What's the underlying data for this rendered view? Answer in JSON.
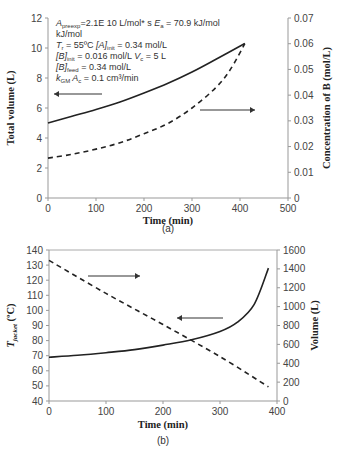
{
  "figure": {
    "panel_a_caption": "(a)",
    "panel_b_caption": "(b)",
    "annotation_a": {
      "line1_prefix": "A",
      "line1_sub": "preexp",
      "line1_text": "=2.1E 10 L/mol* s",
      "line1_E": "E",
      "line1_E_sub": "a",
      "line1_E_text": " = 70.9 kJ/mol",
      "line2": "kJ/mol",
      "line3_T": "T",
      "line3_T_sub": "r",
      "line3_T_text": " = 55ºC",
      "line3_A": "[A]",
      "line3_A_sub": "init",
      "line3_A_text": " = 0.34 mol/L",
      "line4_B": "[B]",
      "line4_B_sub": "init",
      "line4_B_text": " = 0.016 mol/L",
      "line4_V": "V",
      "line4_V_sub": "c",
      "line4_V_text": " = 5 L",
      "line5_B": "[B]",
      "line5_B_sub": "feed",
      "line5_B_text": " = 0.34 mol/L",
      "line6_k": "k",
      "line6_k_sub": "GM",
      "line6_A": " A",
      "line6_A_sub": "c",
      "line6_text": " = 0.1 cm³/min"
    }
  },
  "chart_data": [
    {
      "type": "line",
      "panel": "(a)",
      "title": "",
      "xlabel": "Time (min)",
      "ylabel": "Total volume (L)",
      "y2label": "Concentration of B (mol/L)",
      "xlim": [
        0,
        500
      ],
      "ylim": [
        0,
        12
      ],
      "y2lim": [
        0,
        0.07
      ],
      "xticks": [
        "0",
        "100",
        "200",
        "300",
        "400",
        "500"
      ],
      "yticks": [
        "0",
        "2",
        "4",
        "6",
        "8",
        "10",
        "12"
      ],
      "y2ticks": [
        "0",
        "0.01",
        "0.02",
        "0.03",
        "0.04",
        "0.05",
        "0.06",
        "0.07"
      ],
      "grid": false,
      "series": [
        {
          "name": "Total volume",
          "style": "solid",
          "axis": "left",
          "arrow": "left",
          "x": [
            0,
            50,
            100,
            150,
            200,
            250,
            300,
            350,
            410
          ],
          "values": [
            5.0,
            5.45,
            5.9,
            6.4,
            7.0,
            7.65,
            8.4,
            9.25,
            10.3
          ]
        },
        {
          "name": "Concentration of B",
          "style": "dashed",
          "axis": "right",
          "arrow": "right",
          "x": [
            0,
            50,
            100,
            150,
            200,
            250,
            300,
            350,
            380,
            410
          ],
          "values": [
            0.0155,
            0.017,
            0.019,
            0.0215,
            0.025,
            0.029,
            0.035,
            0.043,
            0.05,
            0.06
          ]
        }
      ]
    },
    {
      "type": "line",
      "panel": "(b)",
      "title": "",
      "xlabel": "Time (min)",
      "ylabel": "T_jacket (ºC)",
      "ylabel_main": "T",
      "ylabel_sub": "jacket",
      "ylabel_unit": " (ºC)",
      "y2label": "Volume (L)",
      "xlim": [
        0,
        400
      ],
      "ylim": [
        40,
        140
      ],
      "y2lim": [
        0,
        1600
      ],
      "xticks": [
        "0",
        "100",
        "200",
        "300",
        "400"
      ],
      "yticks": [
        "40",
        "50",
        "60",
        "70",
        "80",
        "90",
        "100",
        "110",
        "120",
        "130",
        "140"
      ],
      "y2ticks": [
        "0",
        "200",
        "400",
        "600",
        "800",
        "1000",
        "1200",
        "1400",
        "1600"
      ],
      "grid": false,
      "series": [
        {
          "name": "T_jacket",
          "style": "solid",
          "axis": "left",
          "arrow": "left",
          "x": [
            0,
            50,
            100,
            150,
            200,
            250,
            300,
            330,
            360,
            385
          ],
          "values": [
            69,
            70.3,
            72,
            74,
            77,
            80.5,
            86,
            92,
            104,
            128
          ]
        },
        {
          "name": "Volume",
          "style": "dashed",
          "axis": "right",
          "arrow": "right",
          "x": [
            0,
            100,
            200,
            300,
            385
          ],
          "values": [
            1490,
            1140,
            810,
            470,
            150
          ]
        }
      ]
    }
  ]
}
